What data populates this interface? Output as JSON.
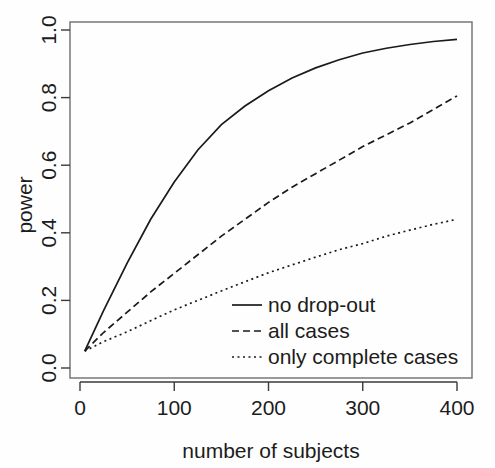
{
  "chart_data": {
    "type": "line",
    "title": "",
    "xlabel": "number of subjects",
    "ylabel": "power",
    "xlim": [
      0,
      420
    ],
    "ylim": [
      0.0,
      1.0
    ],
    "grid": false,
    "legend_position": "bottom-right",
    "xticks": [
      0,
      100,
      200,
      300,
      400
    ],
    "xtick_labels": [
      "0",
      "100",
      "200",
      "300",
      "400"
    ],
    "yticks": [
      0.0,
      0.2,
      0.4,
      0.6,
      0.8,
      1.0
    ],
    "ytick_labels": [
      "0.0",
      "0.2",
      "0.4",
      "0.6",
      "0.8",
      "1.0"
    ],
    "x": [
      5,
      25,
      50,
      75,
      100,
      125,
      150,
      175,
      200,
      225,
      250,
      275,
      300,
      325,
      350,
      375,
      400
    ],
    "series": [
      {
        "name": "no drop-out",
        "style": "solid",
        "color": "#1a1a1a",
        "values": [
          0.05,
          0.17,
          0.31,
          0.44,
          0.55,
          0.645,
          0.72,
          0.775,
          0.82,
          0.858,
          0.888,
          0.912,
          0.932,
          0.946,
          0.957,
          0.966,
          0.972
        ]
      },
      {
        "name": "all cases",
        "style": "dashed",
        "color": "#1a1a1a",
        "values": [
          0.05,
          0.105,
          0.165,
          0.225,
          0.28,
          0.335,
          0.39,
          0.44,
          0.49,
          0.535,
          0.575,
          0.615,
          0.655,
          0.69,
          0.725,
          0.765,
          0.805
        ]
      },
      {
        "name": "only complete cases",
        "style": "dotted",
        "color": "#1a1a1a",
        "values": [
          0.05,
          0.078,
          0.107,
          0.14,
          0.172,
          0.2,
          0.228,
          0.255,
          0.282,
          0.305,
          0.328,
          0.35,
          0.368,
          0.39,
          0.408,
          0.425,
          0.44
        ]
      }
    ]
  },
  "axes": {
    "ylabel": "power",
    "xlabel": "number of subjects"
  },
  "legend": {
    "entries": [
      {
        "label": "no drop-out",
        "style": "solid"
      },
      {
        "label": "all cases",
        "style": "dashed"
      },
      {
        "label": "only complete cases",
        "style": "dotted"
      }
    ]
  }
}
